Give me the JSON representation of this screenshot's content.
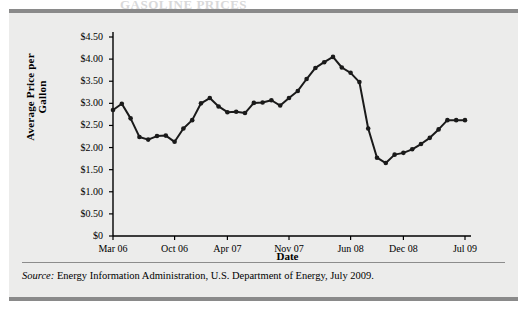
{
  "figure": {
    "cut_off_heading": "GASOLINE PRICES",
    "source_prefix": "Source:",
    "source_text": "Energy Information Administration, U.S. Department of Energy, July 2009."
  },
  "colors": {
    "panel_background": "#ececeb",
    "page_background": "#ffffff",
    "rule": "#8a8a8a",
    "axis": "#000000",
    "line": "#1a1a1a",
    "marker": "#1a1a1a"
  },
  "chart_data": {
    "type": "line",
    "title": "",
    "xlabel": "Date",
    "ylabel": "Average Price per Gallon",
    "ylim": [
      0,
      4.5
    ],
    "grid": false,
    "legend": "none",
    "ytick_labels": [
      "$4.50",
      "$4.00",
      "$3.50",
      "$3.00",
      "$2.50",
      "$2.00",
      "$1.50",
      "$1.00",
      "$0.50",
      "$0"
    ],
    "ytick_values": [
      4.5,
      4.0,
      3.5,
      3.0,
      2.5,
      2.0,
      1.5,
      1.0,
      0.5,
      0
    ],
    "xtick_labels": [
      "Mar 06",
      "Oct 06",
      "Apr 07",
      "Nov 07",
      "Jun 08",
      "Dec 08",
      "Jul 09"
    ],
    "xtick_indices": [
      0,
      7,
      13,
      20,
      27,
      33,
      40
    ],
    "x": [
      "Mar 06",
      "Apr 06",
      "May 06",
      "Jun 06",
      "Jul 06",
      "Aug 06",
      "Sep 06",
      "Oct 06",
      "Nov 06",
      "Dec 06",
      "Jan 07",
      "Feb 07",
      "Mar 07",
      "Apr 07",
      "May 07",
      "Jun 07",
      "Jul 07",
      "Aug 07",
      "Sep 07",
      "Oct 07",
      "Nov 07",
      "Dec 07",
      "Jan 08",
      "Feb 08",
      "Mar 08",
      "Apr 08",
      "May 08",
      "Jun 08",
      "Jul 08",
      "Aug 08",
      "Sep 08",
      "Oct 08",
      "Nov 08",
      "Dec 08",
      "Jan 09",
      "Feb 09",
      "Mar 09",
      "Apr 09",
      "May 09",
      "Jun 09",
      "Jul 09"
    ],
    "values": [
      2.85,
      2.99,
      2.66,
      2.24,
      2.18,
      2.26,
      2.27,
      2.13,
      2.43,
      2.62,
      3.0,
      3.12,
      2.93,
      2.8,
      2.81,
      2.78,
      3.01,
      3.02,
      3.07,
      2.95,
      3.12,
      3.28,
      3.55,
      3.8,
      3.93,
      4.05,
      3.81,
      3.69,
      3.48,
      2.43,
      1.77,
      1.65,
      1.84,
      1.88,
      1.96,
      2.08,
      2.22,
      2.41,
      2.62,
      2.62,
      2.62
    ],
    "series": [
      {
        "name": "Average retail gasoline price",
        "values": [
          2.85,
          2.99,
          2.66,
          2.24,
          2.18,
          2.26,
          2.27,
          2.13,
          2.43,
          2.62,
          3.0,
          3.12,
          2.93,
          2.8,
          2.81,
          2.78,
          3.01,
          3.02,
          3.07,
          2.95,
          3.12,
          3.28,
          3.55,
          3.8,
          3.93,
          4.05,
          3.81,
          3.69,
          3.48,
          2.43,
          1.77,
          1.65,
          1.84,
          1.88,
          1.96,
          2.08,
          2.22,
          2.41,
          2.62,
          2.62,
          2.62
        ]
      }
    ],
    "annotations": {
      "peak_value": 4.05,
      "peak_label": "Jun 08",
      "trough_value": 1.65,
      "trough_label": "Dec 08"
    }
  }
}
